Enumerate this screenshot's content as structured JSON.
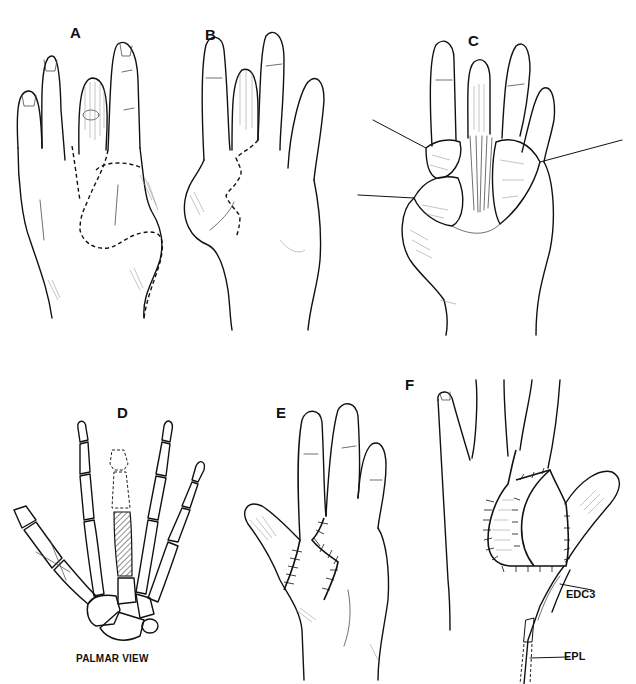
{
  "figure": {
    "panels": [
      {
        "id": "A",
        "label": "A",
        "description": "Dorsal view of hand with dashed incision outline"
      },
      {
        "id": "B",
        "label": "B",
        "description": "Palmar view of hand with zigzag dashed incision"
      },
      {
        "id": "C",
        "label": "C",
        "description": "Opened flaps retracted by four sutures exposing tendons"
      },
      {
        "id": "D",
        "label": "D",
        "description": "Skeleton, palmar view, hatched metacarpal graft"
      },
      {
        "id": "E",
        "label": "E",
        "description": "Palmar view with sutured zigzag incision"
      },
      {
        "id": "F",
        "label": "F",
        "description": "Dorsal view with sutured flaps and tendon transfer"
      }
    ],
    "captions": {
      "palmar_view": "PALMAR VIEW"
    },
    "annotations": {
      "edc3": "EDC3",
      "epl": "EPL"
    }
  }
}
